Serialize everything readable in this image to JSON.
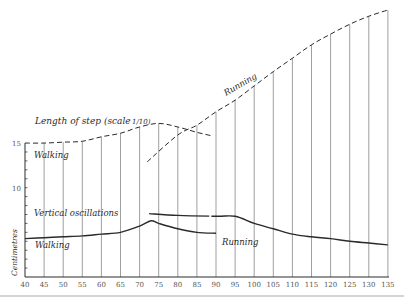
{
  "chart_data": {
    "type": "line",
    "title": "",
    "xlabel": "",
    "ylabel": "Centimetres",
    "xlim": [
      40,
      137
    ],
    "ylim": [
      0,
      30
    ],
    "x_ticks": [
      "40",
      "45",
      "50",
      "55",
      "60",
      "65",
      "70",
      "75",
      "80",
      "85",
      "90",
      "95",
      "100",
      "105",
      "110",
      "115",
      "120",
      "125",
      "130",
      "135"
    ],
    "y_tick_labels": [
      {
        "value": 15,
        "label": "15"
      },
      {
        "value": 10,
        "label": "10"
      }
    ],
    "grid": {
      "vertical": true,
      "horizontal": false
    },
    "annotations": [
      {
        "text": "Length of step (scale 1/10)",
        "x": 48,
        "y": 18
      },
      {
        "text": "Walking",
        "x": 44,
        "y": 13.6
      },
      {
        "text": "Running",
        "x": 97,
        "y": 22.5
      },
      {
        "text": "Vertical oscillations",
        "x": 44,
        "y": 8.2
      },
      {
        "text": "Walking",
        "x": 44,
        "y": 2.9
      },
      {
        "text": "Running",
        "x": 90,
        "y": 3.6
      }
    ],
    "series": [
      {
        "name": "Length of step — Walking",
        "style": "dashed",
        "x": [
          40,
          45,
          50,
          55,
          60,
          65,
          70,
          75,
          80,
          85,
          89
        ],
        "y": [
          15.0,
          15.0,
          15.1,
          15.2,
          15.7,
          16.1,
          16.8,
          17.2,
          16.8,
          16.2,
          15.8
        ]
      },
      {
        "name": "Length of step — Running",
        "style": "dashed",
        "x": [
          72,
          80,
          85,
          90,
          95,
          100,
          105,
          110,
          115,
          120,
          125,
          130,
          135
        ],
        "y": [
          12.9,
          15.9,
          17.0,
          18.5,
          19.8,
          21.4,
          23.0,
          24.5,
          26.0,
          27.2,
          28.3,
          29.2,
          29.9
        ]
      },
      {
        "name": "Vertical oscillations — Walking",
        "style": "solid",
        "x": [
          40,
          45,
          50,
          55,
          60,
          65,
          70,
          73,
          75,
          80,
          85,
          90
        ],
        "y": [
          4.3,
          4.4,
          4.5,
          4.6,
          4.8,
          5.0,
          5.7,
          6.3,
          6.0,
          5.4,
          5.0,
          4.9
        ]
      },
      {
        "name": "Vertical oscillations — Running",
        "style": "solid",
        "x": [
          72.5,
          80,
          90,
          95,
          100,
          105,
          110,
          115,
          120,
          125,
          130,
          135
        ],
        "y": [
          7.1,
          6.9,
          6.8,
          6.8,
          6.0,
          5.4,
          4.8,
          4.5,
          4.3,
          4.0,
          3.8,
          3.6
        ]
      }
    ]
  },
  "labels": {
    "length_of_step": "Length of step (scale",
    "scale_frac": "1/10)",
    "walking_top": "Walking",
    "running_top": "Running",
    "vertical_osc": "Vertical oscillations",
    "walking_bottom": "Walking",
    "running_bottom": "Running",
    "y_axis": "Centimetres"
  },
  "colors": {
    "ink": "#2a2a2a",
    "grid": "#777777",
    "paper": "#ffffff"
  }
}
